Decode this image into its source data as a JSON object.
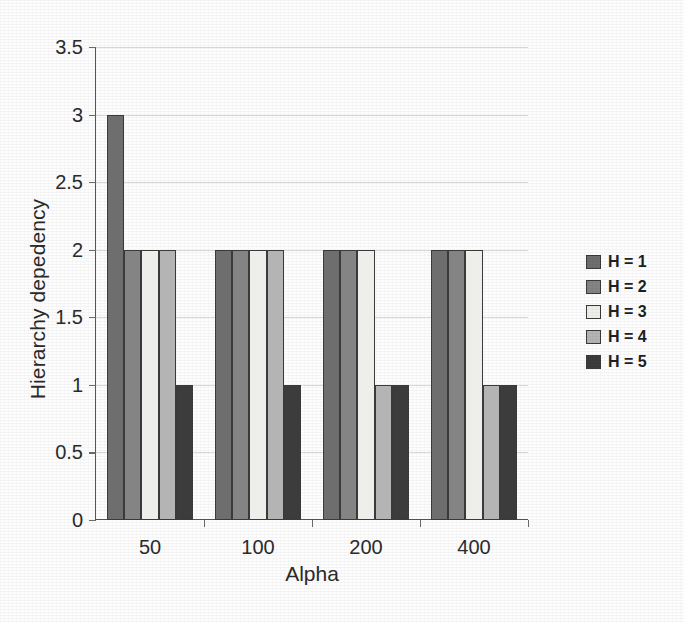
{
  "chart_data": {
    "type": "bar",
    "title": "",
    "subtitle": "",
    "xlabel": "Alpha",
    "ylabel": "Hierarchy depedency",
    "categories": [
      "50",
      "100",
      "200",
      "400"
    ],
    "series": [
      {
        "name": "H = 1",
        "values": [
          3,
          2,
          2,
          2
        ],
        "color": "#6e6e6e"
      },
      {
        "name": "H = 2",
        "values": [
          2,
          2,
          2,
          2
        ],
        "color": "#848484"
      },
      {
        "name": "H = 3",
        "values": [
          2,
          2,
          2,
          2
        ],
        "color": "#eeeeea"
      },
      {
        "name": "H = 4",
        "values": [
          2,
          2,
          1,
          1
        ],
        "color": "#b4b4b4"
      },
      {
        "name": "H = 5",
        "values": [
          1,
          1,
          1,
          1
        ],
        "color": "#3c3c3c"
      }
    ],
    "ylim": [
      0,
      3.5
    ],
    "yticks": [
      "0",
      "0.5",
      "1",
      "1.5",
      "2",
      "2.5",
      "3",
      "3.5"
    ],
    "ytick_values": [
      0,
      0.5,
      1,
      1.5,
      2,
      2.5,
      3,
      3.5
    ],
    "grid": true,
    "grid_axis": "y",
    "legend_position": "right",
    "bar_border_color": "#3a3a3a",
    "grid_color": "#d8d8d8",
    "axis_color": "#555555",
    "background": "#fdfdfd"
  },
  "legend": {
    "entries": [
      {
        "label": "H = 1"
      },
      {
        "label": "H = 2"
      },
      {
        "label": "H = 3"
      },
      {
        "label": "H = 4"
      },
      {
        "label": "H = 5"
      }
    ]
  }
}
